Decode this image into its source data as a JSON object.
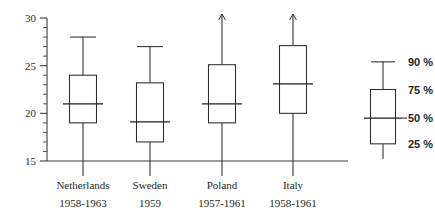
{
  "chart_data": {
    "type": "box",
    "title": "",
    "xlabel": "",
    "ylabel": "",
    "ylim": [
      15,
      30
    ],
    "grid": false,
    "y_major_ticks": [
      15,
      20,
      25,
      30
    ],
    "y_minor_tick_step": 1,
    "y_tick_labels": [
      "15",
      "20",
      "25",
      "30"
    ],
    "legend_position": "right",
    "note": "Whiskers are drawn to the 10th and 90th percentiles; lower whiskers are clipped at the axis baseline of 15. Upward arrowheads on Poland and Italy indicate the upper whisker extends above the plotted range of 30.",
    "categories": [
      {
        "name": "Netherlands",
        "period": "1958-1963",
        "box_top": 24.0,
        "box_bottom": 19.0,
        "median": 21.0,
        "whisker_high": 28.0,
        "whisker_high_capped": true,
        "whisker_high_arrow": false,
        "whisker_low_clipped": true
      },
      {
        "name": "Sweden",
        "period": "1959",
        "box_top": 23.2,
        "box_bottom": 17.0,
        "median": 19.1,
        "whisker_high": 27.0,
        "whisker_high_capped": true,
        "whisker_high_arrow": false,
        "whisker_low_clipped": true
      },
      {
        "name": "Poland",
        "period": "1957-1961",
        "box_top": 25.1,
        "box_bottom": 19.0,
        "median": 21.0,
        "whisker_high": 30.0,
        "whisker_high_capped": false,
        "whisker_high_arrow": true,
        "whisker_low_clipped": true
      },
      {
        "name": "Italy",
        "period": "1958-1961",
        "box_top": 27.1,
        "box_bottom": 20.0,
        "median": 23.1,
        "whisker_high": 30.0,
        "whisker_high_capped": false,
        "whisker_high_arrow": true,
        "whisker_low_clipped": true
      }
    ],
    "legend_key": {
      "schematic_box_top": 22.5,
      "schematic_box_bottom": 16.8,
      "schematic_median": 19.5,
      "schematic_whisker_high": 25.4,
      "schematic_whisker_low": 15.2,
      "entries": [
        {
          "id": "p90",
          "label": "90 %",
          "value": 25.4
        },
        {
          "id": "p75",
          "label": "75 %",
          "value": 22.5
        },
        {
          "id": "p50",
          "label": "50 %",
          "value": 19.5
        },
        {
          "id": "p25",
          "label": "25 %",
          "value": 16.8
        }
      ]
    }
  }
}
